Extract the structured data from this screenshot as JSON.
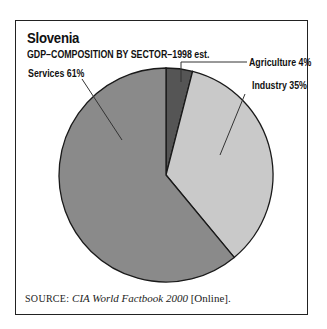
{
  "chart_data": {
    "type": "pie",
    "title": "Slovenia",
    "subtitle": "GDP–COMPOSITION BY SECTOR–1998 est.",
    "categories": [
      "Agriculture",
      "Industry",
      "Services"
    ],
    "values": [
      4,
      35,
      61
    ],
    "unit": "%",
    "labels": [
      "Agriculture 4%",
      "Industry 35%",
      "Services 61%"
    ],
    "colors": [
      "#555555",
      "#c9c9c9",
      "#8a8a8a"
    ],
    "start_angle_deg": 0,
    "direction": "clockwise",
    "legend": "none (leader-line labels)"
  },
  "header": {
    "title": "Slovenia",
    "subtitle": "GDP–COMPOSITION BY SECTOR–1998 est."
  },
  "labels": {
    "agriculture": "Agriculture 4%",
    "industry": "Industry 35%",
    "services": "Services 61%"
  },
  "source": {
    "prefix": "SOURCE:",
    "title": "CIA World Factbook 2000",
    "suffix": "[Online]."
  }
}
